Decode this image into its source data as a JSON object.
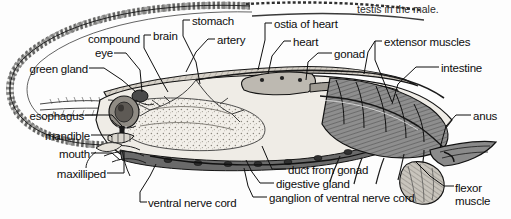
{
  "figure": {
    "caption_fragment": "testis in the male.",
    "ink": "#1a1a1a",
    "background": "#fdfdfd",
    "tones": {
      "carapace_fill": "#cfcac2",
      "muscle_dark": "#6f6f6f",
      "muscle_mid": "#9a9a9a",
      "gland_light": "#efece6",
      "outline": "#141414"
    }
  },
  "labels": [
    {
      "id": "green-gland",
      "text": "green gland",
      "x": 88,
      "y": 71,
      "align": "right"
    },
    {
      "id": "compound-eye",
      "text": "compound",
      "x": 140,
      "y": 41,
      "align": "right"
    },
    {
      "id": "compound-eye-2",
      "text": "eye",
      "x": 113,
      "y": 56,
      "align": "right"
    },
    {
      "id": "esophagus",
      "text": "esophagus",
      "x": 84,
      "y": 118,
      "align": "right"
    },
    {
      "id": "mandible",
      "text": "mandible",
      "x": 90,
      "y": 138,
      "align": "right"
    },
    {
      "id": "mouth",
      "text": "mouth",
      "x": 90,
      "y": 156,
      "align": "right"
    },
    {
      "id": "maxilliped",
      "text": "maxilliped",
      "x": 106,
      "y": 176,
      "align": "right"
    },
    {
      "id": "brain",
      "text": "brain",
      "x": 152,
      "y": 38,
      "align": "left"
    },
    {
      "id": "stomach",
      "text": "stomach",
      "x": 191,
      "y": 23,
      "align": "left"
    },
    {
      "id": "artery",
      "text": "artery",
      "x": 216,
      "y": 42,
      "align": "left"
    },
    {
      "id": "ostia-of-heart",
      "text": "ostia of heart",
      "x": 273,
      "y": 26,
      "align": "left"
    },
    {
      "id": "heart",
      "text": "heart",
      "x": 292,
      "y": 44,
      "align": "left"
    },
    {
      "id": "gonad",
      "text": "gonad",
      "x": 333,
      "y": 56,
      "align": "left"
    },
    {
      "id": "extensor-muscles",
      "text": "extensor muscles",
      "x": 383,
      "y": 44,
      "align": "left"
    },
    {
      "id": "intestine",
      "text": "intestine",
      "x": 440,
      "y": 70,
      "align": "left"
    },
    {
      "id": "anus",
      "text": "anus",
      "x": 472,
      "y": 118,
      "align": "left"
    },
    {
      "id": "duct-from-gonad",
      "text": "duct from gonad",
      "x": 287,
      "y": 172,
      "align": "left"
    },
    {
      "id": "digestive-gland",
      "text": "digestive gland",
      "x": 275,
      "y": 186,
      "align": "left"
    },
    {
      "id": "ganglion",
      "text": "ganglion of ventral nerve cord",
      "x": 268,
      "y": 200,
      "align": "left"
    },
    {
      "id": "ventral-nerve-cord",
      "text": "ventral nerve cord",
      "x": 146,
      "y": 205,
      "align": "left"
    },
    {
      "id": "flexor-muscle",
      "text": "flexor\nmuscle",
      "x": 452,
      "y": 190,
      "align": "left"
    }
  ]
}
